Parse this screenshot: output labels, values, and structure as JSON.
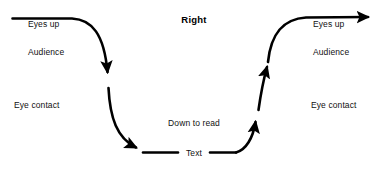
{
  "diagram": {
    "title": "Right",
    "stroke_color": "#000000",
    "background_color": "#ffffff",
    "text_color": "#111111",
    "left_side": {
      "eyes_up": "Eyes up",
      "audience": "Audience",
      "eye_contact": "Eye contact"
    },
    "right_side": {
      "eyes_up": "Eyes up",
      "audience": "Audience",
      "eye_contact": "Eye contact"
    },
    "center": {
      "down_to_read": "Down to read",
      "text": "Text"
    }
  }
}
